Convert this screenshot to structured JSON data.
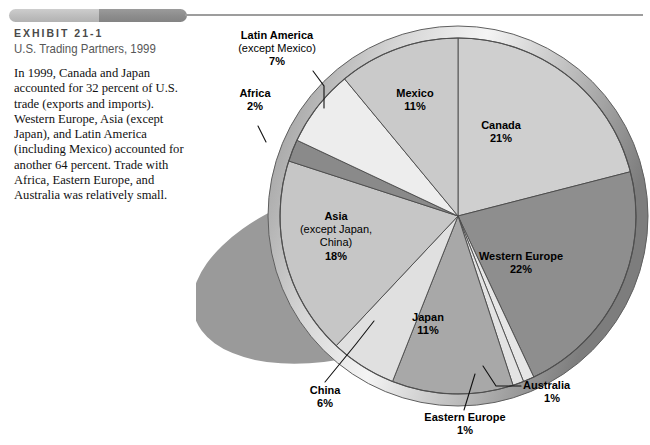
{
  "header": {
    "kicker": "EXHIBIT 21-1",
    "title": "U.S. Trading Partners, 1999",
    "bar_light": "#c3c3c3",
    "bar_dark": "#8f8f8f",
    "rule_color": "#9d9d9d"
  },
  "caption": {
    "body": "In 1999, Canada and Japan accounted for 32 percent of U.S. trade (exports and imports). Western Europe, Asia (except Japan), and Latin America (including Mexico) accounted for another 64 percent. Trade with Africa, Eastern Europe, and Australia was relatively small."
  },
  "chart_data": {
    "type": "pie",
    "title": "U.S. Trading Partners, 1999",
    "subtitle": "",
    "xlabel": "",
    "ylabel": "",
    "units": "percent of U.S. trade",
    "grid": false,
    "legend": "none",
    "label_format": "name + percent",
    "start_angle_deg": 0,
    "direction": "clockwise",
    "total": 100,
    "categories": [
      "Canada",
      "Western Europe",
      "Australia",
      "Eastern Europe",
      "Japan",
      "China",
      "Asia (except Japan, China)",
      "Africa",
      "Latin America (except Mexico)",
      "Mexico"
    ],
    "values": [
      21,
      22,
      1,
      1,
      11,
      6,
      18,
      2,
      7,
      11
    ],
    "slices": [
      {
        "name": "Canada",
        "label": "Canada",
        "sub": "",
        "value": 21,
        "display": "21%",
        "color": "#cfcfcf",
        "label_pos": "inside"
      },
      {
        "name": "Western Europe",
        "label": "Western Europe",
        "sub": "",
        "value": 22,
        "display": "22%",
        "color": "#8e8e8e",
        "label_pos": "inside"
      },
      {
        "name": "Australia",
        "label": "Australia",
        "sub": "",
        "value": 1,
        "display": "1%",
        "color": "#e6e6e6",
        "label_pos": "outside"
      },
      {
        "name": "Eastern Europe",
        "label": "Eastern Europe",
        "sub": "",
        "value": 1,
        "display": "1%",
        "color": "#e3e3e3",
        "label_pos": "outside"
      },
      {
        "name": "Japan",
        "label": "Japan",
        "sub": "",
        "value": 11,
        "display": "11%",
        "color": "#a8a8a8",
        "label_pos": "inside"
      },
      {
        "name": "China",
        "label": "China",
        "sub": "",
        "value": 6,
        "display": "6%",
        "color": "#e0e0e0",
        "label_pos": "outside"
      },
      {
        "name": "Asia",
        "label": "Asia",
        "sub": "(except Japan, China)",
        "value": 18,
        "display": "18%",
        "color": "#c6c6c6",
        "label_pos": "inside"
      },
      {
        "name": "Africa",
        "label": "Africa",
        "sub": "",
        "value": 2,
        "display": "2%",
        "color": "#8a8a8a",
        "label_pos": "outside"
      },
      {
        "name": "Latin America",
        "label": "Latin America",
        "sub": "(except Mexico)",
        "value": 7,
        "display": "7%",
        "color": "#ededed",
        "label_pos": "outside"
      },
      {
        "name": "Mexico",
        "label": "Mexico",
        "sub": "",
        "value": 11,
        "display": "11%",
        "color": "#cacaca",
        "label_pos": "inside"
      }
    ]
  },
  "labels": {
    "latin_america_name": "Latin America",
    "latin_america_sub": "(except Mexico)",
    "latin_america_pct": "7%",
    "africa_name": "Africa",
    "africa_pct": "2%",
    "mexico_name": "Mexico",
    "mexico_pct": "11%",
    "canada_name": "Canada",
    "canada_pct": "21%",
    "western_europe_name": "Western Europe",
    "western_europe_pct": "22%",
    "asia_name": "Asia",
    "asia_sub1": "(except Japan,",
    "asia_sub2": "China)",
    "asia_pct": "18%",
    "japan_name": "Japan",
    "japan_pct": "11%",
    "china_name": "China",
    "china_pct": "6%",
    "australia_name": "Australia",
    "australia_pct": "1%",
    "eastern_europe_name": "Eastern Europe",
    "eastern_europe_pct": "1%"
  }
}
